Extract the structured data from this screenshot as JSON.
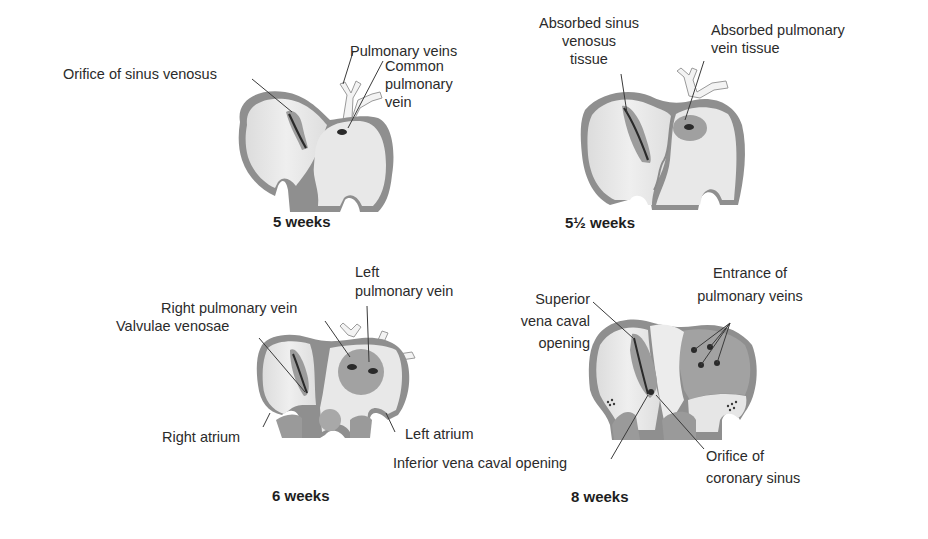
{
  "panels": [
    {
      "id": "5-weeks",
      "caption": "5 weeks",
      "labels": {
        "orifice_sinus_venosus": "Orifice of sinus venosus",
        "pulmonary_veins": "Pulmonary veins",
        "common_pulmonary_vein_1": "Common",
        "common_pulmonary_vein_2": "pulmonary",
        "common_pulmonary_vein_3": "vein"
      }
    },
    {
      "id": "5-half-weeks",
      "caption": "5½ weeks",
      "labels": {
        "absorbed_sinus_1": "Absorbed sinus",
        "absorbed_sinus_2": "venosus",
        "absorbed_sinus_3": "tissue",
        "absorbed_pulm_1": "Absorbed pulmonary",
        "absorbed_pulm_2": "vein tissue"
      }
    },
    {
      "id": "6-weeks",
      "caption": "6 weeks",
      "labels": {
        "left_pulm_1": "Left",
        "left_pulm_2": "pulmonary vein",
        "right_pulm": "Right pulmonary vein",
        "valvulae": "Valvulae venosae",
        "right_atrium": "Right atrium",
        "left_atrium": "Left atrium"
      }
    },
    {
      "id": "8-weeks",
      "caption": "8 weeks",
      "labels": {
        "svc_1": "Superior",
        "svc_2": "vena caval",
        "svc_3": "opening",
        "entrance_1": "Entrance of",
        "entrance_2": "pulmonary veins",
        "ivc": "Inferior vena caval opening",
        "coronary_1": "Orifice of",
        "coronary_2": "coronary sinus"
      }
    }
  ],
  "colors": {
    "wall": "#8f8f8f",
    "wall_dark": "#7a7a7a",
    "chamber": "#e4e4e4",
    "chamber_light": "#eeeeee",
    "tissue": "#9a9a9a",
    "leader": "#3a3a3a",
    "vein": "#f2f2f2"
  }
}
